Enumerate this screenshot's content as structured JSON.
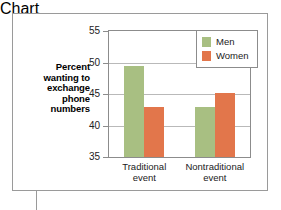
{
  "chart_data": {
    "type": "bar",
    "title": "",
    "subtitle": "",
    "xlabel": "",
    "ylabel": "Percent wanting to exchange phone numbers",
    "ylabel_lines": [
      "Percent",
      "wanting to",
      "exchange",
      "phone",
      "numbers"
    ],
    "categories": [
      "Traditional event",
      "Nontraditional event"
    ],
    "category_lines": [
      [
        "Traditional",
        "event"
      ],
      [
        "Nontraditional",
        "event"
      ]
    ],
    "series": [
      {
        "name": "Men",
        "color": "#a8bf82",
        "values": [
          49.5,
          43.0
        ]
      },
      {
        "name": "Women",
        "color": "#e2764b",
        "values": [
          43.0,
          45.2
        ]
      }
    ],
    "ylim": [
      35,
      55
    ],
    "yticks": [
      35,
      40,
      45,
      50,
      55
    ],
    "ytick_labels": [
      "35",
      "40",
      "45",
      "50",
      "55"
    ],
    "grid": true,
    "legend_position": "top-right",
    "legend_entries": [
      "Men",
      "Women"
    ]
  },
  "figure": {
    "background_color": "#ffffff",
    "frame_color": "#9a9a9a",
    "plot_frame_color": "#8c8c8c",
    "gridline_color": "#b9b9b9"
  }
}
